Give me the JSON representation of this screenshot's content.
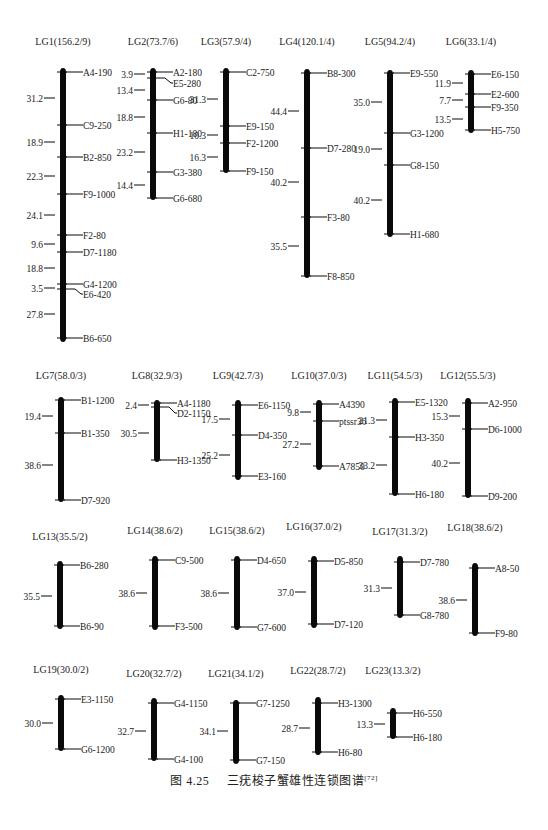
{
  "caption": {
    "figure_number": "图 4.25",
    "title": "三疣梭子蟹雄性连锁图谱",
    "reference": "[72]"
  },
  "colors": {
    "bar": "#0a0a0a",
    "text": "#1a1a1a",
    "background": "#ffffff"
  },
  "linkage_groups": [
    {
      "id": "LG1",
      "title": "LG1(156.2/9)",
      "bar_x": 63,
      "title_y": 45,
      "top": 68,
      "bottom": 342,
      "markers": [
        {
          "name": "A4-190",
          "y": 72
        },
        {
          "name": "C9-250",
          "y": 125
        },
        {
          "name": "B2-850",
          "y": 157
        },
        {
          "name": "F9-1000",
          "y": 194
        },
        {
          "name": "F2-80",
          "y": 235
        },
        {
          "name": "D7-1180",
          "y": 252
        },
        {
          "name": "G4-1200",
          "y": 284
        },
        {
          "name": "E6-420",
          "y": 294,
          "label_y": 294,
          "kink": true,
          "from_y": 289
        },
        {
          "name": "B6-650",
          "y": 338
        }
      ],
      "distances": [
        {
          "value": "31.2",
          "y": 98
        },
        {
          "value": "18.9",
          "y": 142
        },
        {
          "value": "22.3",
          "y": 176
        },
        {
          "value": "24.1",
          "y": 215
        },
        {
          "value": "9.6",
          "y": 244
        },
        {
          "value": "18.8",
          "y": 268
        },
        {
          "value": "3.5",
          "y": 288
        },
        {
          "value": "27.8",
          "y": 314
        }
      ]
    },
    {
      "id": "LG2",
      "title": "LG2(73.7/6)",
      "bar_x": 153,
      "title_y": 45,
      "top": 68,
      "bottom": 200,
      "markers": [
        {
          "name": "A2-180",
          "y": 72
        },
        {
          "name": "E5-280",
          "y": 83,
          "kink": true,
          "from_y": 78
        },
        {
          "name": "G6-80",
          "y": 100
        },
        {
          "name": "H1-180",
          "y": 133
        },
        {
          "name": "G3-380",
          "y": 172
        },
        {
          "name": "G6-680",
          "y": 198
        }
      ],
      "distances": [
        {
          "value": "3.9",
          "y": 74
        },
        {
          "value": "13.4",
          "y": 90
        },
        {
          "value": "18.8",
          "y": 117
        },
        {
          "value": "23.2",
          "y": 152
        },
        {
          "value": "14.4",
          "y": 185
        }
      ]
    },
    {
      "id": "LG3",
      "title": "LG3(57.9/4)",
      "bar_x": 226,
      "title_y": 45,
      "top": 68,
      "bottom": 173,
      "markers": [
        {
          "name": "C2-750",
          "y": 72
        },
        {
          "name": "E9-150",
          "y": 126
        },
        {
          "name": "F2-1200",
          "y": 143
        },
        {
          "name": "F9-150",
          "y": 171
        }
      ],
      "distances": [
        {
          "value": "31.3",
          "y": 99
        },
        {
          "value": "10.3",
          "y": 135
        },
        {
          "value": "16.3",
          "y": 157
        }
      ]
    },
    {
      "id": "LG4",
      "title": "LG4(120.1/4)",
      "bar_x": 307,
      "title_y": 45,
      "top": 69,
      "bottom": 278,
      "markers": [
        {
          "name": "B8-300",
          "y": 73
        },
        {
          "name": "D7-280",
          "y": 148
        },
        {
          "name": "F3-80",
          "y": 217
        },
        {
          "name": "F8-850",
          "y": 276
        }
      ],
      "distances": [
        {
          "value": "44.4",
          "y": 111
        },
        {
          "value": "40.2",
          "y": 182
        },
        {
          "value": "35.5",
          "y": 246
        }
      ]
    },
    {
      "id": "LG5",
      "title": "LG5(94.2/4)",
      "bar_x": 390,
      "title_y": 45,
      "top": 70,
      "bottom": 237,
      "markers": [
        {
          "name": "E9-550",
          "y": 73
        },
        {
          "name": "G3-1200",
          "y": 133
        },
        {
          "name": "G8-150",
          "y": 165
        },
        {
          "name": "H1-680",
          "y": 234
        }
      ],
      "distances": [
        {
          "value": "35.0",
          "y": 102
        },
        {
          "value": "19.0",
          "y": 149
        },
        {
          "value": "40.2",
          "y": 200
        }
      ]
    },
    {
      "id": "LG6",
      "title": "LG6(33.1/4)",
      "bar_x": 471,
      "title_y": 45,
      "top": 70,
      "bottom": 133,
      "markers": [
        {
          "name": "E6-150",
          "y": 74
        },
        {
          "name": "E2-600",
          "y": 94
        },
        {
          "name": "F9-350",
          "y": 107
        },
        {
          "name": "H5-750",
          "y": 130
        }
      ],
      "distances": [
        {
          "value": "11.9",
          "y": 83
        },
        {
          "value": "7.7",
          "y": 100
        },
        {
          "value": "13.5",
          "y": 119
        }
      ]
    },
    {
      "id": "LG7",
      "title": "LG7(58.0/3)",
      "bar_x": 61,
      "title_y": 379,
      "top": 397,
      "bottom": 502,
      "markers": [
        {
          "name": "B1-1200",
          "y": 400
        },
        {
          "name": "B1-350",
          "y": 433
        },
        {
          "name": "D7-920",
          "y": 500
        }
      ],
      "distances": [
        {
          "value": "19.4",
          "y": 416
        },
        {
          "value": "38.6",
          "y": 465
        }
      ]
    },
    {
      "id": "LG8",
      "title": "LG8(32.9/3)",
      "bar_x": 157,
      "title_y": 379,
      "top": 400,
      "bottom": 462,
      "markers": [
        {
          "name": "A4-1180",
          "y": 403
        },
        {
          "name": "D2-1150",
          "y": 413,
          "kink": true,
          "from_y": 407
        },
        {
          "name": "H3-1350",
          "y": 460
        }
      ],
      "distances": [
        {
          "value": "2.4",
          "y": 405
        },
        {
          "value": "30.5",
          "y": 433
        }
      ]
    },
    {
      "id": "LG9",
      "title": "LG9(42.7/3)",
      "bar_x": 238,
      "title_y": 379,
      "top": 400,
      "bottom": 480,
      "markers": [
        {
          "name": "E6-1150",
          "y": 405
        },
        {
          "name": "D4-350",
          "y": 435
        },
        {
          "name": "E3-160",
          "y": 476
        }
      ],
      "distances": [
        {
          "value": "17.5",
          "y": 419
        },
        {
          "value": "25.2",
          "y": 455
        }
      ]
    },
    {
      "id": "LG10",
      "title": "LG10(37.0/3)",
      "bar_x": 319,
      "title_y": 379,
      "top": 400,
      "bottom": 470,
      "markers": [
        {
          "name": "A4390",
          "y": 404
        },
        {
          "name": "ptssr36",
          "y": 421
        },
        {
          "name": "A7850",
          "y": 466
        }
      ],
      "distances": [
        {
          "value": "9.8",
          "y": 412
        },
        {
          "value": "27.2",
          "y": 444
        }
      ]
    },
    {
      "id": "LG11",
      "title": "LG11(54.5/3)",
      "bar_x": 395,
      "title_y": 379,
      "top": 398,
      "bottom": 496,
      "markers": [
        {
          "name": "E5-1320",
          "y": 402
        },
        {
          "name": "H3-350",
          "y": 437
        },
        {
          "name": "H6-180",
          "y": 494
        }
      ],
      "distances": [
        {
          "value": "21.3",
          "y": 420
        },
        {
          "value": "33.2",
          "y": 465
        }
      ]
    },
    {
      "id": "LG12",
      "title": "LG12(55.5/3)",
      "bar_x": 468,
      "title_y": 379,
      "top": 398,
      "bottom": 498,
      "markers": [
        {
          "name": "A2-950",
          "y": 403
        },
        {
          "name": "D6-1000",
          "y": 429
        },
        {
          "name": "D9-200",
          "y": 496
        }
      ],
      "distances": [
        {
          "value": "15.3",
          "y": 416
        },
        {
          "value": "40.2",
          "y": 463
        }
      ]
    },
    {
      "id": "LG13",
      "title": "LG13(35.5/2)",
      "bar_x": 60,
      "title_y": 540,
      "top": 561,
      "bottom": 629,
      "markers": [
        {
          "name": "B6-280",
          "y": 565
        },
        {
          "name": "B6-90",
          "y": 626
        }
      ],
      "distances": [
        {
          "value": "35.5",
          "y": 596
        }
      ]
    },
    {
      "id": "LG14",
      "title": "LG14(38.6/2)",
      "bar_x": 155,
      "title_y": 534,
      "top": 556,
      "bottom": 630,
      "markers": [
        {
          "name": "C9-500",
          "y": 560
        },
        {
          "name": "F3-500",
          "y": 626
        }
      ],
      "distances": [
        {
          "value": "38.6",
          "y": 593
        }
      ]
    },
    {
      "id": "LG15",
      "title": "LG15(38.6/2)",
      "bar_x": 237,
      "title_y": 534,
      "top": 556,
      "bottom": 630,
      "markers": [
        {
          "name": "D4-650",
          "y": 560
        },
        {
          "name": "G7-600",
          "y": 627
        }
      ],
      "distances": [
        {
          "value": "38.6",
          "y": 593
        }
      ]
    },
    {
      "id": "LG16",
      "title": "LG16(37.0/2)",
      "bar_x": 314,
      "title_y": 530,
      "top": 556,
      "bottom": 628,
      "markers": [
        {
          "name": "D5-850",
          "y": 561
        },
        {
          "name": "D7-120",
          "y": 624
        }
      ],
      "distances": [
        {
          "value": "37.0",
          "y": 592
        }
      ]
    },
    {
      "id": "LG17",
      "title": "LG17(31.3/2)",
      "bar_x": 400,
      "title_y": 535,
      "top": 556,
      "bottom": 618,
      "markers": [
        {
          "name": "D7-780",
          "y": 562
        },
        {
          "name": "G8-780",
          "y": 615
        }
      ],
      "distances": [
        {
          "value": "31.3",
          "y": 588
        }
      ]
    },
    {
      "id": "LG18",
      "title": "LG18(38.6/2)",
      "bar_x": 475,
      "title_y": 531,
      "top": 563,
      "bottom": 636,
      "markers": [
        {
          "name": "A8-50",
          "y": 568
        },
        {
          "name": "F9-80",
          "y": 633
        }
      ],
      "distances": [
        {
          "value": "38.6",
          "y": 600
        }
      ]
    },
    {
      "id": "LG19",
      "title": "LG19(30.0/2)",
      "bar_x": 61,
      "title_y": 673,
      "top": 695,
      "bottom": 751,
      "markers": [
        {
          "name": "E3-1150",
          "y": 699
        },
        {
          "name": "G6-1200",
          "y": 749
        }
      ],
      "distances": [
        {
          "value": "30.0",
          "y": 723
        }
      ]
    },
    {
      "id": "LG20",
      "title": "LG20(32.7/2)",
      "bar_x": 154,
      "title_y": 677,
      "top": 698,
      "bottom": 761,
      "markers": [
        {
          "name": "G4-1150",
          "y": 703
        },
        {
          "name": "G4-100",
          "y": 759
        }
      ],
      "distances": [
        {
          "value": "32.7",
          "y": 731
        }
      ]
    },
    {
      "id": "LG21",
      "title": "LG21(34.1/2)",
      "bar_x": 236,
      "title_y": 677,
      "top": 700,
      "bottom": 764,
      "markers": [
        {
          "name": "G7-1250",
          "y": 703
        },
        {
          "name": "G7-150",
          "y": 760
        }
      ],
      "distances": [
        {
          "value": "34.1",
          "y": 731
        }
      ]
    },
    {
      "id": "LG22",
      "title": "LG22(28.7/2)",
      "bar_x": 318,
      "title_y": 674,
      "top": 697,
      "bottom": 755,
      "markers": [
        {
          "name": "H3-1300",
          "y": 703
        },
        {
          "name": "H6-80",
          "y": 752
        }
      ],
      "distances": [
        {
          "value": "28.7",
          "y": 728
        }
      ]
    },
    {
      "id": "LG23",
      "title": "LG23(13.3/2)",
      "bar_x": 393,
      "title_y": 674,
      "top": 708,
      "bottom": 739,
      "markers": [
        {
          "name": "H6-550",
          "y": 713
        },
        {
          "name": "H6-180",
          "y": 737
        }
      ],
      "distances": [
        {
          "value": "13.3",
          "y": 724
        }
      ]
    }
  ]
}
